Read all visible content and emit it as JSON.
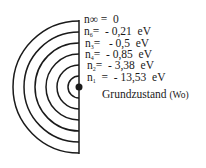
{
  "diagram": {
    "type": "bohr-energy-levels",
    "stroke_color": "#1a1a1a",
    "levels": [
      {
        "n": "∞",
        "label": "n∞",
        "sub": "",
        "equals": "=",
        "value": "0",
        "unit": ""
      },
      {
        "n": "6",
        "label": "n",
        "sub": "6",
        "equals": "=",
        "value": "- 0,21",
        "unit": "eV"
      },
      {
        "n": "3",
        "label": "n",
        "sub": "3",
        "equals": "=",
        "value": "- 0,5",
        "unit": "eV"
      },
      {
        "n": "4",
        "label": "n",
        "sub": "4",
        "equals": "=",
        "value": "- 0,85",
        "unit": "eV"
      },
      {
        "n": "2",
        "label": "n",
        "sub": "2",
        "equals": "=",
        "value": "- 3,38",
        "unit": "eV"
      },
      {
        "n": "1",
        "label": "n",
        "sub": "1",
        "equals": "=",
        "value": "- 13,53",
        "unit": "eV"
      }
    ],
    "ground_state": {
      "label": "Grundzustand",
      "symbol": "(Wo)"
    }
  }
}
